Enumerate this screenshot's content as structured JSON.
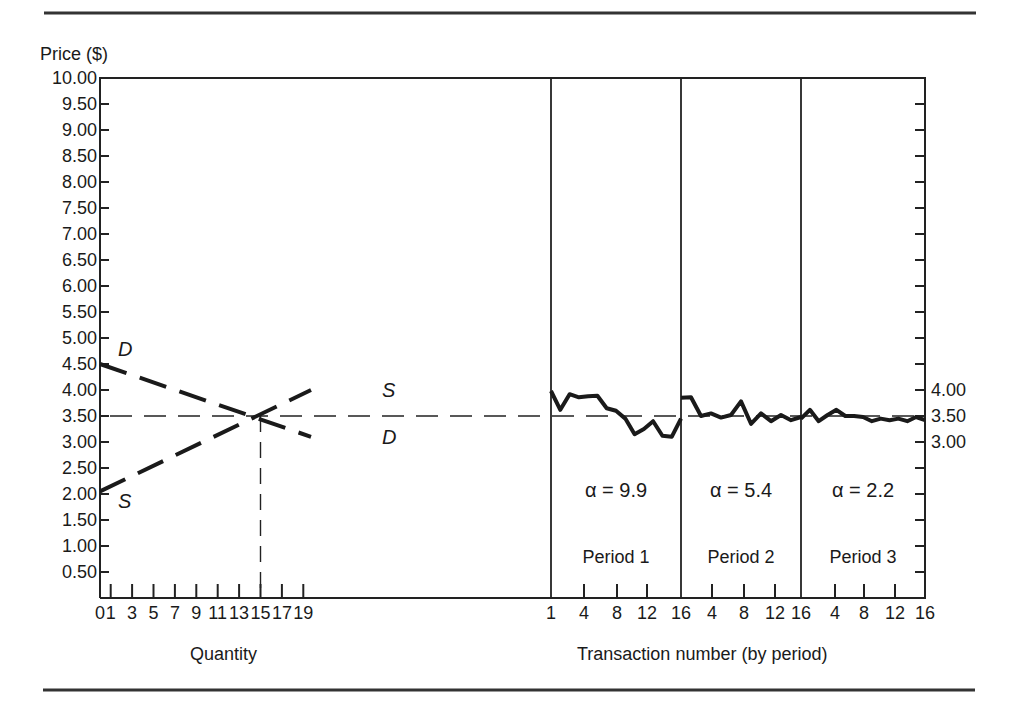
{
  "chart_data": {
    "type": "line",
    "title": "",
    "ylabel": "Price ($)",
    "ylim": [
      0,
      10
    ],
    "yticks": [
      "10.00",
      "9.50",
      "9.00",
      "8.50",
      "8.00",
      "7.50",
      "7.00",
      "6.50",
      "6.00",
      "5.50",
      "5.00",
      "4.50",
      "4.00",
      "3.50",
      "3.00",
      "2.50",
      "2.00",
      "1.50",
      "1.00",
      "0.50"
    ],
    "right_yticks": [
      "4.00",
      "3.50",
      "3.00"
    ],
    "equilibrium_price": 3.5,
    "equilibrium_quantity": 15,
    "left_panel": {
      "xlabel": "Quantity",
      "xticks": [
        "0",
        "1",
        "3",
        "5",
        "7",
        "9",
        "11",
        "13",
        "15",
        "17",
        "19"
      ],
      "demand": {
        "name": "D",
        "points": [
          [
            0,
            4.5
          ],
          [
            20,
            3.1
          ]
        ]
      },
      "supply": {
        "name": "S",
        "points": [
          [
            0,
            2.05
          ],
          [
            20,
            4.0
          ]
        ]
      }
    },
    "right_panel": {
      "xlabel": "Transaction number (by period)",
      "xticks": [
        "1",
        "4",
        "8",
        "12",
        "16",
        "4",
        "8",
        "12",
        "16",
        "4",
        "8",
        "12",
        "16"
      ],
      "periods": [
        {
          "label": "Period 1",
          "alpha": "α = 9.9",
          "prices": [
            3.98,
            3.62,
            3.92,
            3.86,
            3.88,
            3.89,
            3.65,
            3.6,
            3.45,
            3.15,
            3.25,
            3.4,
            3.12,
            3.1,
            3.45
          ]
        },
        {
          "label": "Period 2",
          "alpha": "α = 5.4",
          "prices": [
            3.85,
            3.86,
            3.5,
            3.55,
            3.47,
            3.52,
            3.78,
            3.35,
            3.55,
            3.4,
            3.52,
            3.42,
            3.48
          ]
        },
        {
          "label": "Period 3",
          "alpha": "α = 2.2",
          "prices": [
            3.45,
            3.62,
            3.4,
            3.52,
            3.62,
            3.5,
            3.5,
            3.48,
            3.4,
            3.45,
            3.42,
            3.45,
            3.4,
            3.48,
            3.42
          ]
        }
      ]
    }
  },
  "labels": {
    "price_axis": "Price ($)",
    "quantity_axis": "Quantity",
    "transaction_axis": "Transaction number (by period)",
    "demand_label": "D",
    "supply_label": "S"
  }
}
